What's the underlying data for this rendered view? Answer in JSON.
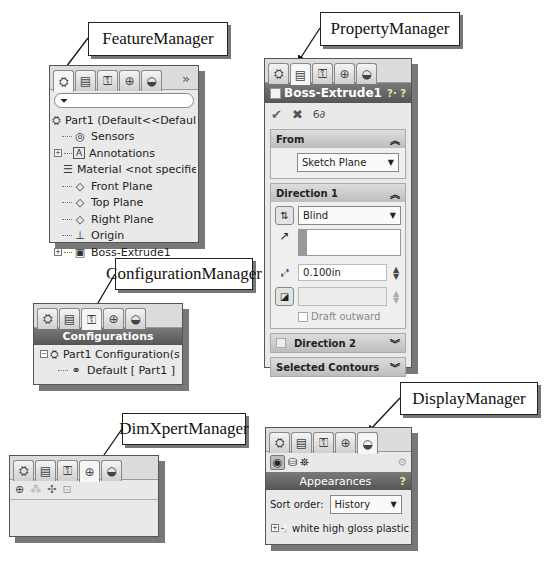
{
  "callouts": {
    "feature": "FeatureManager",
    "property": "PropertyManager",
    "configuration": "ConfigurationManager",
    "dimxpert": "DimXpertManager",
    "display": "DisplayManager"
  },
  "icons": {
    "feature_tab": "feature-manager-tab-icon",
    "property_tab": "property-manager-tab-icon",
    "config_tab": "configuration-manager-tab-icon",
    "dimxpert_tab": "dimxpert-manager-tab-icon",
    "display_tab": "display-manager-tab-icon"
  },
  "feature_manager": {
    "more": "»",
    "filter_icon": "⏷",
    "tree": [
      {
        "label": "Part1  (Default<<Default>_Disp",
        "icon": "⛭",
        "expand": ""
      },
      {
        "label": "Sensors",
        "icon": "◎",
        "expand": ""
      },
      {
        "label": "Annotations",
        "icon": "A",
        "expand": "+"
      },
      {
        "label": "Material <not specified>",
        "icon": "☰",
        "expand": ""
      },
      {
        "label": "Front Plane",
        "icon": "◇",
        "expand": ""
      },
      {
        "label": "Top Plane",
        "icon": "◇",
        "expand": ""
      },
      {
        "label": "Right Plane",
        "icon": "◇",
        "expand": ""
      },
      {
        "label": "Origin",
        "icon": "⊥",
        "expand": ""
      },
      {
        "label": "Boss-Extrude1",
        "icon": "▣",
        "expand": "+"
      }
    ]
  },
  "property_manager": {
    "title": "Boss-Extrude1",
    "help": "?· ?",
    "ok": "✔",
    "cancel": "✖",
    "preview": "6∂",
    "from": {
      "header": "From",
      "value": "Sketch Plane"
    },
    "direction1": {
      "header": "Direction 1",
      "end_condition": "Blind",
      "depth": "0.100in",
      "draft_label": "Draft outward"
    },
    "direction2": {
      "header": "Direction 2"
    },
    "selected_contours": {
      "header": "Selected Contours"
    }
  },
  "configuration_manager": {
    "title": "Configurations",
    "tree": [
      {
        "label": "Part1 Configuration(s)"
      },
      {
        "label": "Default [ Part1 ]"
      }
    ]
  },
  "dimxpert_manager": {
    "toolbar": [
      "⊕",
      "⁂",
      "✣",
      "⊡"
    ]
  },
  "display_manager": {
    "title": "Appearances",
    "help": "?",
    "sort_label": "Sort order:",
    "sort_value": "History",
    "items": [
      {
        "label": "white high gloss plastic"
      }
    ]
  }
}
